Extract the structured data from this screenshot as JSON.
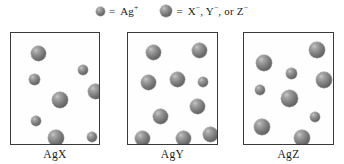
{
  "legend": {
    "entries": [
      {
        "icon": "small-gray-sphere",
        "equals": "=",
        "label": "Ag",
        "charge": "+",
        "species": "Ag+",
        "sphere_size_px": 9
      },
      {
        "icon": "large-gray-sphere",
        "equals": "=",
        "label_parts": [
          "X",
          ", Y",
          ", or Z"
        ],
        "label": "X−, Y−, or Z−",
        "charge": "−",
        "species": "X-, Y-, or Z-",
        "sphere_size_px": 12
      }
    ]
  },
  "colors": {
    "sphere_fill": "#6e6e6e",
    "sphere_highlight": "#c8c8c8",
    "box_border": "#3a3a3a",
    "box_fill": "#fefefe",
    "page_background": "#ffffff",
    "text": "#1a1a1a"
  },
  "boxes": [
    {
      "id": "box-agx",
      "label": "AgX",
      "compound": "AgX",
      "counts": {
        "cations": 4,
        "anions": 4,
        "total": 8
      },
      "frame": {
        "x": 10,
        "y": 10,
        "w": 90,
        "h": 113
      },
      "spheres": [
        {
          "species": "anion",
          "d": 15,
          "cx": 27,
          "cy": 20
        },
        {
          "species": "cation",
          "d": 10,
          "cx": 72,
          "cy": 37
        },
        {
          "species": "cation",
          "d": 11,
          "cx": 23,
          "cy": 46
        },
        {
          "species": "anion",
          "d": 15,
          "cx": 84,
          "cy": 58
        },
        {
          "species": "anion",
          "d": 16,
          "cx": 49,
          "cy": 67
        },
        {
          "species": "cation",
          "d": 10,
          "cx": 25,
          "cy": 88
        },
        {
          "species": "anion",
          "d": 16,
          "cx": 45,
          "cy": 105
        },
        {
          "species": "cation",
          "d": 10,
          "cx": 81,
          "cy": 104
        }
      ]
    },
    {
      "id": "box-agy",
      "label": "AgY",
      "compound": "AgY",
      "counts": {
        "cations": 1,
        "anions": 9,
        "total": 10
      },
      "frame": {
        "x": 127,
        "y": 10,
        "w": 91,
        "h": 113
      },
      "spheres": [
        {
          "species": "anion",
          "d": 15,
          "cx": 25,
          "cy": 19
        },
        {
          "species": "anion",
          "d": 15,
          "cx": 71,
          "cy": 17
        },
        {
          "species": "anion",
          "d": 15,
          "cx": 20,
          "cy": 49
        },
        {
          "species": "anion",
          "d": 15,
          "cx": 49,
          "cy": 46
        },
        {
          "species": "cation",
          "d": 10,
          "cx": 75,
          "cy": 49
        },
        {
          "species": "anion",
          "d": 15,
          "cx": 69,
          "cy": 73
        },
        {
          "species": "anion",
          "d": 15,
          "cx": 32,
          "cy": 83
        },
        {
          "species": "anion",
          "d": 15,
          "cx": 14,
          "cy": 105
        },
        {
          "species": "anion",
          "d": 15,
          "cx": 55,
          "cy": 105
        },
        {
          "species": "anion",
          "d": 15,
          "cx": 82,
          "cy": 101
        }
      ]
    },
    {
      "id": "box-agz",
      "label": "AgZ",
      "compound": "AgZ",
      "counts": {
        "cations": 3,
        "anions": 6,
        "total": 9
      },
      "frame": {
        "x": 243,
        "y": 10,
        "w": 91,
        "h": 113
      },
      "spheres": [
        {
          "species": "anion",
          "d": 16,
          "cx": 73,
          "cy": 17
        },
        {
          "species": "anion",
          "d": 16,
          "cx": 20,
          "cy": 30
        },
        {
          "species": "cation",
          "d": 11,
          "cx": 47,
          "cy": 40
        },
        {
          "species": "anion",
          "d": 16,
          "cx": 80,
          "cy": 47
        },
        {
          "species": "cation",
          "d": 10,
          "cx": 16,
          "cy": 57
        },
        {
          "species": "anion",
          "d": 17,
          "cx": 45,
          "cy": 65
        },
        {
          "species": "cation",
          "d": 10,
          "cx": 71,
          "cy": 84
        },
        {
          "species": "anion",
          "d": 16,
          "cx": 18,
          "cy": 94
        },
        {
          "species": "anion",
          "d": 16,
          "cx": 58,
          "cy": 105
        }
      ]
    }
  ]
}
